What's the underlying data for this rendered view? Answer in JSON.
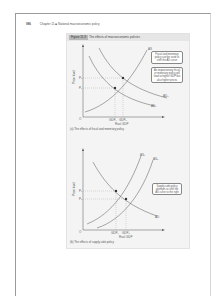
{
  "running_head": {
    "page_number": "986",
    "text": "Chapter 11 ■ National macroeconomic policy"
  },
  "figure": {
    "label": "Figure 11.3",
    "title": "The effects of macroeconomic policies",
    "panel_a": {
      "caption": "(a) The effects of fiscal and monetary policy",
      "ylabel": "Price level",
      "xlabel": "Real GDP",
      "origin": "O",
      "y_ticks": [
        "P1",
        "P2"
      ],
      "x_ticks": [
        "GDP1",
        "GDP2"
      ],
      "curves": [
        "AS",
        "AD1",
        "AD2"
      ],
      "callouts": [
        "Fiscal and monetary policy can be used to shift the AD curve",
        "An expansionary fiscal or monetary policy will lead to higher GDP but also higher prices"
      ]
    },
    "panel_b": {
      "caption": "(b) The effects of supply-side policy",
      "ylabel": "Price level",
      "xlabel": "Real GDP",
      "origin": "O",
      "y_ticks": [
        "P1",
        "P2"
      ],
      "x_ticks": [
        "GDP1",
        "GDP2"
      ],
      "curves": [
        "AS1",
        "AS2",
        "AD"
      ],
      "callouts": [
        "Supply-side policy attempts to shift the AS curve to the right"
      ]
    }
  }
}
